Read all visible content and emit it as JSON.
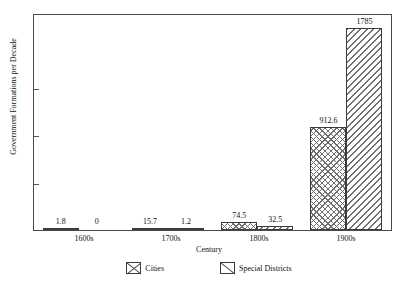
{
  "chart_data": {
    "type": "bar",
    "title": "",
    "xlabel": "Century",
    "ylabel": "Government Formations per Decade",
    "categories": [
      "1600s",
      "1700s",
      "1800s",
      "1900s"
    ],
    "series": [
      {
        "name": "Cities",
        "pattern": "crosshatch",
        "values": [
          1.8,
          15.7,
          74.5,
          912.6
        ],
        "labels": [
          "1.8",
          "15.7",
          "74.5",
          "912.6"
        ]
      },
      {
        "name": "Special Districts",
        "pattern": "diagonal-stripes",
        "values": [
          0,
          1.2,
          32.5,
          1785
        ],
        "labels": [
          "0",
          "1.2",
          "32.5",
          "1785"
        ]
      }
    ],
    "ylim": [
      0,
      1900
    ],
    "y_tick_labels": [],
    "grid": false,
    "legend_position": "bottom",
    "frame": true,
    "colors": {
      "line": "#3b3b3b",
      "hatch": "#6f6f6f",
      "background": "#ffffff"
    }
  },
  "legend": {
    "entries": [
      {
        "label": "Cities"
      },
      {
        "label": "Special Districts"
      }
    ]
  }
}
